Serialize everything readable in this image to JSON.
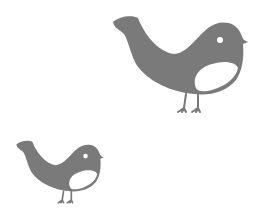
{
  "scene": {
    "background": "#ffffff",
    "birds": [
      {
        "id": "large-bird",
        "fill": "#7a7a7a",
        "belly": "#ffffff",
        "eye": "#ffffff"
      },
      {
        "id": "small-bird",
        "fill": "#7a7a7a",
        "belly": "#ffffff",
        "eye": "#ffffff"
      }
    ]
  }
}
